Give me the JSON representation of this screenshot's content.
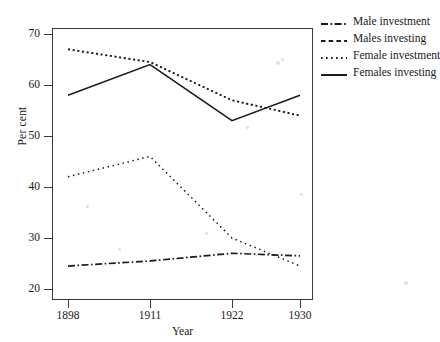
{
  "chart_data": {
    "type": "line",
    "title": "",
    "xlabel": "Year",
    "ylabel": "Per cent",
    "categories": [
      "1898",
      "1911",
      "1922",
      "1930"
    ],
    "x_positions": [
      68,
      150,
      232,
      300
    ],
    "ylim": [
      20,
      70
    ],
    "yticks": [
      20,
      30,
      40,
      50,
      60,
      70
    ],
    "grid": false,
    "legend_position": "right",
    "series": [
      {
        "name": "Male investment",
        "style": "dashdot",
        "color": "#1a1a1a",
        "values": [
          24.5,
          25.5,
          27.0,
          26.5
        ]
      },
      {
        "name": "Males investing",
        "style": "fine-dotted",
        "color": "#1a1a1a",
        "values": [
          67.0,
          64.5,
          57.0,
          54.0
        ]
      },
      {
        "name": "Female investment",
        "style": "sparse-dotted",
        "color": "#1a1a1a",
        "values": [
          42.0,
          46.0,
          30.0,
          24.5
        ]
      },
      {
        "name": "Females investing",
        "style": "solid",
        "color": "#1a1a1a",
        "values": [
          58.0,
          64.0,
          53.0,
          58.0
        ]
      }
    ]
  },
  "axes": {
    "ylabel": "Per cent",
    "xlabel": "Year",
    "ytick_labels": [
      "20",
      "30",
      "40",
      "50",
      "60",
      "70"
    ],
    "xtick_labels": [
      "1898",
      "1911",
      "1922",
      "1930"
    ]
  },
  "legend": {
    "items": [
      {
        "label": "Male investment",
        "key": "dashdot-line-key"
      },
      {
        "label": "Males investing",
        "key": "dashed-line-key"
      },
      {
        "label": "Female investment",
        "key": "dotted-line-key"
      },
      {
        "label": "Females investing",
        "key": "solid-line-key"
      }
    ]
  }
}
